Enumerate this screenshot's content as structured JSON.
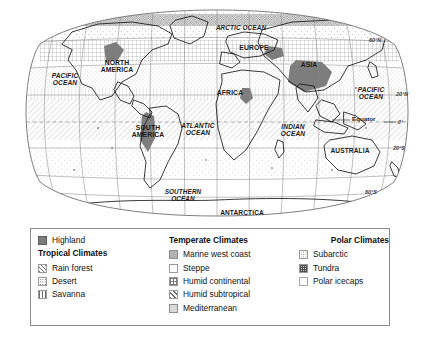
{
  "map": {
    "title": "World climate regions map",
    "projection": "Robinson",
    "ocean_labels": [
      {
        "name": "arctic-ocean",
        "text": "ARCTIC OCEAN",
        "x": 241,
        "y": 28,
        "size": 6.4
      },
      {
        "name": "pacific-ocean-west",
        "text": "PACIFIC\nOCEAN",
        "x": 65,
        "y": 80,
        "size": 6.6
      },
      {
        "name": "atlantic-ocean",
        "text": "ATLANTIC\nOCEAN",
        "x": 198,
        "y": 130,
        "size": 6.6
      },
      {
        "name": "indian-ocean",
        "text": "INDIAN\nOCEAN",
        "x": 293,
        "y": 131,
        "size": 6.6
      },
      {
        "name": "pacific-ocean-east",
        "text": "PACIFIC\nOCEAN",
        "x": 371,
        "y": 94,
        "size": 6.6
      },
      {
        "name": "southern-ocean",
        "text": "SOUTHERN\nOCEAN",
        "x": 183,
        "y": 196,
        "size": 6.4
      }
    ],
    "continent_labels": [
      {
        "name": "north-america",
        "text": "NORTH\nAMERICA",
        "x": 117,
        "y": 67,
        "size": 6.8
      },
      {
        "name": "south-america",
        "text": "SOUTH\nAMERICA",
        "x": 148,
        "y": 132,
        "size": 6.8
      },
      {
        "name": "europe",
        "text": "EUROPE",
        "x": 254,
        "y": 48,
        "size": 6.8
      },
      {
        "name": "asia",
        "text": "ASIA",
        "x": 309,
        "y": 65,
        "size": 6.8
      },
      {
        "name": "africa",
        "text": "AFRICA",
        "x": 230,
        "y": 93,
        "size": 6.8
      },
      {
        "name": "australia",
        "text": "AUSTRALIA",
        "x": 350,
        "y": 151,
        "size": 6.6
      },
      {
        "name": "antarctica",
        "text": "ANTARCTICA",
        "x": 242,
        "y": 213,
        "size": 6.6
      }
    ],
    "latitude_labels": [
      {
        "name": "lat-60n",
        "text": "60°N",
        "x": 369,
        "y": 40
      },
      {
        "name": "lat-20n",
        "text": "20°N",
        "x": 392,
        "y": 94
      },
      {
        "name": "lat-0",
        "text": "0°",
        "x": 394,
        "y": 122
      },
      {
        "name": "lat-20s",
        "text": "20°S",
        "x": 389,
        "y": 148
      },
      {
        "name": "lat-60s",
        "text": "60°S",
        "x": 365,
        "y": 192
      }
    ],
    "equator_label": {
      "name": "equator",
      "text": "Equator",
      "x": 352,
      "y": 119
    }
  },
  "legend": {
    "columns": [
      {
        "id": "column-1",
        "standalone": [
          {
            "key": "highland",
            "label": "Highland",
            "swatch": "sw-highland"
          }
        ],
        "heading": "Tropical Climates",
        "items": [
          {
            "key": "rain-forest",
            "label": "Rain forest",
            "swatch": "sw-rainforest"
          },
          {
            "key": "desert",
            "label": "Desert",
            "swatch": "sw-desert"
          },
          {
            "key": "savanna",
            "label": "Savanna",
            "swatch": "sw-savanna"
          }
        ]
      },
      {
        "id": "column-2",
        "standalone": [],
        "heading": "Temperate Climates",
        "items": [
          {
            "key": "marine-west-coast",
            "label": "Marine west coast",
            "swatch": "sw-marine"
          },
          {
            "key": "steppe",
            "label": "Steppe",
            "swatch": "sw-steppe"
          },
          {
            "key": "humid-continental",
            "label": "Humid continental",
            "swatch": "sw-humidcont"
          },
          {
            "key": "humid-subtropical",
            "label": "Humid subtropical",
            "swatch": "sw-humidsub"
          },
          {
            "key": "mediterranean",
            "label": "Mediterranean",
            "swatch": "sw-marine"
          }
        ]
      },
      {
        "id": "column-3",
        "standalone": [],
        "heading": "Polar Climates",
        "items": [
          {
            "key": "subarctic",
            "label": "Subarctic",
            "swatch": "sw-subarctic"
          },
          {
            "key": "tundra",
            "label": "Tundra",
            "swatch": "sw-tundra"
          },
          {
            "key": "polar-icecaps",
            "label": "Polar icecaps",
            "swatch": "sw-polarice"
          }
        ]
      }
    ]
  },
  "colors": {
    "line": "#6a6a6a",
    "coast": "#1a1a1a",
    "highland_fill": "#7d7d7d",
    "legend_border": "#8a8a8a",
    "background": "#ffffff"
  }
}
